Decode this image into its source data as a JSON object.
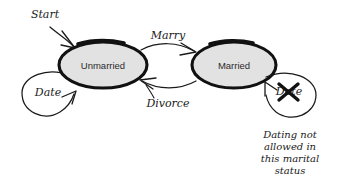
{
  "diagram": {
    "background_color": "#ffffff",
    "ink_color": "#1a1a1a",
    "state_fill_color": "#e2e2e2",
    "state_stroke_color": "#111111",
    "states": [
      {
        "id": "unmarried",
        "label": "Unmarried",
        "cx": 103,
        "cy": 65,
        "rx": 44,
        "ry": 23
      },
      {
        "id": "married",
        "label": "Married",
        "cx": 234,
        "cy": 65,
        "rx": 42,
        "ry": 23
      }
    ],
    "transitions": [
      {
        "id": "start",
        "label": "Start",
        "from": "",
        "to": "unmarried",
        "label_x": 45,
        "label_y": 15
      },
      {
        "id": "marry",
        "label": "Marry",
        "from": "unmarried",
        "to": "married",
        "label_x": 168,
        "label_y": 36
      },
      {
        "id": "divorce",
        "label": "Divorce",
        "from": "married",
        "to": "unmarried",
        "label_x": 168,
        "label_y": 104
      },
      {
        "id": "date-unmarried",
        "label": "Date",
        "from": "unmarried",
        "to": "unmarried",
        "label_x": 48,
        "label_y": 93
      },
      {
        "id": "date-married",
        "label": "Date",
        "from": "married",
        "to": "married",
        "label_x": 289,
        "label_y": 92,
        "struck_out": true
      }
    ],
    "annotation": {
      "id": "dating-not-allowed-note",
      "lines": [
        "Dating not",
        "allowed in",
        "this marital",
        "status"
      ],
      "x": 290,
      "y": 138
    }
  }
}
